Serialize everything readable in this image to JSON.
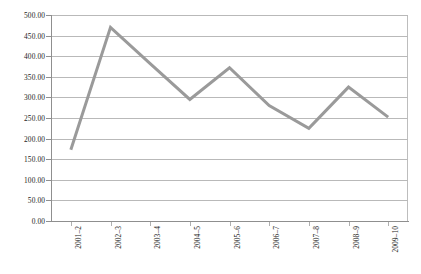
{
  "chart_data": {
    "type": "line",
    "title": "",
    "subtitle": "",
    "xlabel": "",
    "ylabel": "",
    "categories": [
      "2001–2",
      "2002–3",
      "2003–4",
      "2004–5",
      "2005–6",
      "2006–7",
      "2007–8",
      "2008–9",
      "2009–10"
    ],
    "values": [
      173,
      470,
      382,
      295,
      372,
      280,
      225,
      325,
      252
    ],
    "series": [
      {
        "name": "Series 1",
        "values": [
          173,
          470,
          382,
          295,
          372,
          280,
          225,
          325,
          252
        ]
      }
    ],
    "ylim": [
      0,
      500
    ],
    "ytick_step": 50,
    "ytick_labels": [
      "0.00",
      "50.00",
      "100.00",
      "150.00",
      "200.00",
      "250.00",
      "300.00",
      "350.00",
      "400.00",
      "450.00",
      "500.00"
    ],
    "ytick_values": [
      0,
      50,
      100,
      150,
      200,
      250,
      300,
      350,
      400,
      450,
      500
    ],
    "grid": true,
    "grid_axis": "y",
    "legend": false,
    "legend_position": "none",
    "markers": false,
    "line_color": "#9a9a9a",
    "line_width": 3,
    "gridline_color": "#b9b9b9",
    "axis_color": "#8f8f8f",
    "background_color": "#ffffff",
    "annotations": []
  }
}
